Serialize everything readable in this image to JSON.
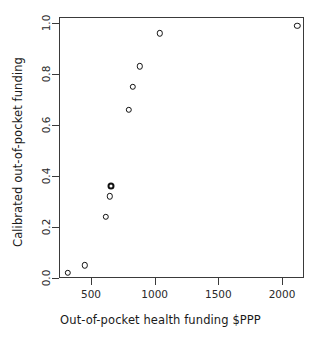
{
  "figure": {
    "clipped_top_text": "",
    "background": "#ffffff",
    "frame_color": "#3a3a3a",
    "marker_color": "#111111"
  },
  "chart_data": {
    "type": "scatter",
    "title": "",
    "xlabel": "Out-of-pocket health funding $PPP",
    "ylabel": "Calibrated out-of-pocket funding",
    "xlim": [
      240,
      2200
    ],
    "ylim": [
      -0.02,
      1.04
    ],
    "xticks": [
      500,
      1000,
      1500,
      2000
    ],
    "xtick_labels": [
      "500",
      "1000",
      "1500",
      "2000"
    ],
    "yticks": [
      0.0,
      0.2,
      0.4,
      0.6,
      0.8,
      1.0
    ],
    "ytick_labels": [
      "0.0",
      "0.2",
      "0.4",
      "0.6",
      "0.8",
      "1.0"
    ],
    "grid": false,
    "legend": null,
    "marker": "open-circle",
    "points": [
      {
        "x": 320,
        "y": 0.02,
        "overlap": 1
      },
      {
        "x": 450,
        "y": 0.05,
        "overlap": 1
      },
      {
        "x": 615,
        "y": 0.24,
        "overlap": 1
      },
      {
        "x": 647,
        "y": 0.32,
        "overlap": 1
      },
      {
        "x": 658,
        "y": 0.36,
        "overlap": 2
      },
      {
        "x": 795,
        "y": 0.66,
        "overlap": 1
      },
      {
        "x": 827,
        "y": 0.75,
        "overlap": 1
      },
      {
        "x": 882,
        "y": 0.83,
        "overlap": 1
      },
      {
        "x": 1040,
        "y": 0.96,
        "overlap": 1
      },
      {
        "x": 2120,
        "y": 0.99,
        "overlap": 1
      }
    ]
  }
}
